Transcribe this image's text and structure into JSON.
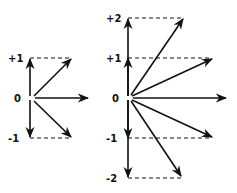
{
  "diagrams": [
    {
      "name": "left-phasor-diagram",
      "labels": {
        "plus1": "+1",
        "zero": "0",
        "minus1": "-1"
      }
    },
    {
      "name": "right-phasor-diagram",
      "labels": {
        "plus2": "+2",
        "plus1": "+1",
        "zero": "0",
        "minus1": "-1",
        "minus2": "-2"
      }
    }
  ]
}
